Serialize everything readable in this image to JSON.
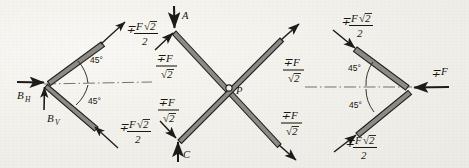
{
  "figure": {
    "background_color": "#f4f2ee",
    "ink_color": "#1d1b19",
    "member_fill_color": "#8d8b85",
    "panel_count": 3
  },
  "panels": [
    {
      "id": "left",
      "name": "support-reaction-diagram",
      "description": "Two bars meeting at a left vertex with support reactions",
      "angles": [
        {
          "name": "upper-angle",
          "value": "45",
          "unit": "°"
        },
        {
          "name": "lower-angle",
          "value": "45",
          "unit": "°"
        }
      ],
      "labels": [
        {
          "name": "upper-member-force",
          "sign": "∓",
          "numerator_var": "F",
          "radical": "2",
          "denominator": "2"
        },
        {
          "name": "lower-member-force",
          "sign": "∓",
          "numerator_var": "F",
          "radical": "2",
          "denominator": "2"
        },
        {
          "name": "horizontal-reaction",
          "base": "B",
          "sub": "H"
        },
        {
          "name": "vertical-reaction",
          "base": "B",
          "sub": "V"
        }
      ]
    },
    {
      "id": "middle",
      "name": "crossed-members-diagram",
      "description": "Two crossing bars intersecting at point P with four end forces",
      "points": [
        {
          "name": "point-a",
          "text": "A"
        },
        {
          "name": "point-c",
          "text": "C"
        },
        {
          "name": "point-p",
          "text": "P"
        }
      ],
      "labels": [
        {
          "name": "force-upper-left",
          "sign": "∓",
          "numerator_var": "F",
          "denominator_radical": "2"
        },
        {
          "name": "force-lower-left",
          "sign": "∓",
          "numerator_var": "F",
          "denominator_radical": "2"
        },
        {
          "name": "force-upper-right",
          "sign": "∓",
          "numerator_var": "F",
          "denominator_radical": "2"
        },
        {
          "name": "force-lower-right",
          "sign": "∓",
          "numerator_var": "F",
          "denominator_radical": "2"
        }
      ]
    },
    {
      "id": "right",
      "name": "applied-load-diagram",
      "description": "Two bars meeting at a right vertex with applied load F",
      "angles": [
        {
          "name": "upper-angle",
          "value": "45",
          "unit": "°"
        },
        {
          "name": "lower-angle",
          "value": "45",
          "unit": "°"
        }
      ],
      "labels": [
        {
          "name": "upper-member-force",
          "sign": "∓",
          "numerator_var": "F",
          "radical": "2",
          "denominator": "2"
        },
        {
          "name": "lower-member-force",
          "sign": "∓",
          "numerator_var": "F",
          "radical": "2",
          "denominator": "2"
        },
        {
          "name": "applied-force",
          "sign": "∓",
          "text": "F"
        }
      ]
    }
  ],
  "symbols": {
    "minus_plus": "∓",
    "degree": "°",
    "force": "F",
    "radical_two": "2",
    "two": "2",
    "point_a": "A",
    "point_c": "C",
    "point_p": "P",
    "b_base": "B",
    "sub_h": "H",
    "sub_v": "V",
    "angle_45": "45"
  }
}
